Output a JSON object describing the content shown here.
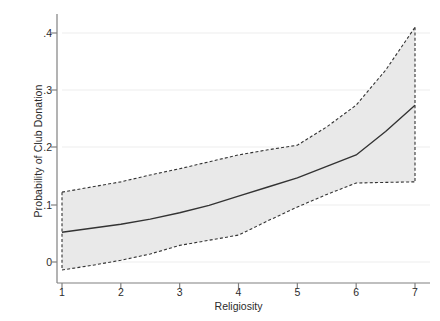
{
  "chart_data": {
    "type": "line",
    "title": "",
    "subtitle": "",
    "xlabel": "Religiosity",
    "ylabel": "Probability of Club Donation",
    "xlim": [
      1,
      7
    ],
    "ylim": [
      -0.035,
      0.42
    ],
    "xticks": [
      1,
      2,
      3,
      4,
      5,
      6,
      7
    ],
    "xtick_labels": [
      "1",
      "2",
      "3",
      "4",
      "5",
      "6",
      "7"
    ],
    "yticks": [
      0,
      0.1,
      0.2,
      0.3,
      0.4
    ],
    "ytick_labels": [
      "0",
      ".1",
      ".2",
      ".3",
      ".4"
    ],
    "grid": "horizontal",
    "legend": "none",
    "x": [
      1,
      1.5,
      2,
      2.5,
      3,
      3.5,
      4,
      4.5,
      5,
      5.5,
      6,
      6.5,
      7
    ],
    "series": [
      {
        "name": "Predicted probability",
        "style": "solid",
        "color": "#333333",
        "values": [
          0.052,
          0.059,
          0.066,
          0.075,
          0.086,
          0.099,
          0.115,
          0.131,
          0.147,
          0.167,
          0.187,
          0.228,
          0.274
        ]
      },
      {
        "name": "Upper 95% confidence bound",
        "style": "dashed",
        "color": "#333333",
        "values": [
          0.122,
          0.131,
          0.14,
          0.152,
          0.163,
          0.175,
          0.187,
          0.196,
          0.204,
          0.236,
          0.274,
          0.335,
          0.41
        ]
      },
      {
        "name": "Lower 95% confidence bound",
        "style": "dashed",
        "color": "#333333",
        "values": [
          -0.014,
          -0.006,
          0.003,
          0.014,
          0.029,
          0.038,
          0.047,
          0.072,
          0.096,
          0.118,
          0.138,
          0.139,
          0.14
        ]
      }
    ],
    "band": {
      "name": "95% confidence interval",
      "fill": "#e9e9e9",
      "edge_style": "dashed",
      "upper_series": "Upper 95% confidence bound",
      "lower_series": "Lower 95% confidence bound"
    },
    "colors": {
      "background": "#ffffff",
      "axis": "#808080",
      "gridline": "#ededed",
      "band_fill": "#e9e9e9",
      "line": "#333333",
      "text": "#2b2b2b"
    }
  }
}
